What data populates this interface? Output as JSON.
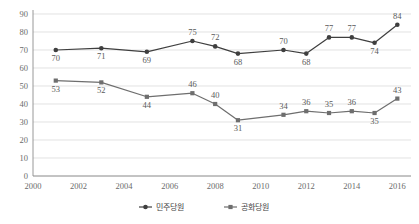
{
  "chart_data": {
    "type": "line",
    "title": "",
    "subtitle": "",
    "xlabel": "",
    "ylabel": "",
    "x": [
      2001,
      2003,
      2005,
      2007,
      2008,
      2009,
      2011,
      2012,
      2013,
      2014,
      2015,
      2016
    ],
    "xlim": [
      2000,
      2016.6
    ],
    "ylim": [
      0,
      90
    ],
    "ytick_step": 10,
    "yticks": [
      "0",
      "10",
      "20",
      "30",
      "40",
      "50",
      "60",
      "70",
      "80",
      "90"
    ],
    "xticks": [
      "2000",
      "2002",
      "2004",
      "2006",
      "2008",
      "2010",
      "2012",
      "2014",
      "2016"
    ],
    "grid": true,
    "grid_axis": "y",
    "legend_position": "bottom",
    "series": [
      {
        "name": "민주당원",
        "marker": "circle",
        "color": "#3f3f3f",
        "values": [
          70,
          71,
          69,
          75,
          72,
          68,
          70,
          68,
          77,
          77,
          74,
          84
        ],
        "label_positions": [
          "below",
          "below",
          "below",
          "above",
          "above",
          "below",
          "above",
          "below",
          "above",
          "above",
          "below",
          "above"
        ]
      },
      {
        "name": "공화당원",
        "marker": "square",
        "color": "#6e6e6e",
        "values": [
          53,
          52,
          44,
          46,
          40,
          31,
          34,
          36,
          35,
          36,
          35,
          43
        ],
        "label_positions": [
          "below",
          "below",
          "below",
          "above",
          "above",
          "below",
          "above",
          "above",
          "above",
          "above",
          "below",
          "above"
        ]
      }
    ]
  },
  "legend": {
    "items": [
      {
        "label": "민주당원",
        "marker": "circle"
      },
      {
        "label": "공화당원",
        "marker": "square"
      }
    ]
  }
}
